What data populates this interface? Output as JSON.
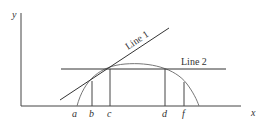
{
  "diagram": {
    "type": "economics-curve-with-tangent-lines",
    "colors": {
      "axes": "#444444",
      "lines": "#333333",
      "curve": "#777777",
      "text": "#333333"
    },
    "axes": {
      "y_label": "y",
      "x_label": "x"
    },
    "lines": [
      {
        "id": "line1",
        "label": "Line 1",
        "kind": "tangent"
      },
      {
        "id": "line2",
        "label": "Line 2",
        "kind": "horizontal"
      }
    ],
    "x_markers": [
      "a",
      "b",
      "c",
      "d",
      "f"
    ],
    "curve": {
      "shape": "concave arc",
      "starts_at": "a",
      "ends_at": "past f"
    }
  }
}
